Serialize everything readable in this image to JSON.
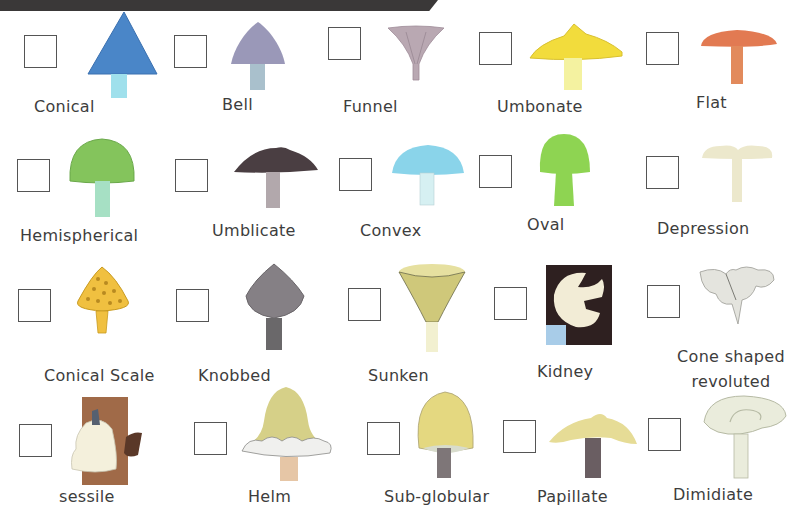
{
  "options": [
    {
      "id": "conical",
      "label": "Conical",
      "checked": false
    },
    {
      "id": "bell",
      "label": "Bell",
      "checked": false
    },
    {
      "id": "funnel",
      "label": "Funnel",
      "checked": false
    },
    {
      "id": "umbonate",
      "label": "Umbonate",
      "checked": false
    },
    {
      "id": "flat",
      "label": "Flat",
      "checked": false
    },
    {
      "id": "hemispherical",
      "label": "Hemispherical",
      "checked": false
    },
    {
      "id": "umblicate",
      "label": "Umblicate",
      "checked": false
    },
    {
      "id": "convex",
      "label": "Convex",
      "checked": false
    },
    {
      "id": "oval",
      "label": "Oval",
      "checked": false
    },
    {
      "id": "depression",
      "label": "Depression",
      "checked": false
    },
    {
      "id": "conical-scale",
      "label": "Conical Scale",
      "checked": false
    },
    {
      "id": "knobbed",
      "label": "Knobbed",
      "checked": false
    },
    {
      "id": "sunken",
      "label": "Sunken",
      "checked": false
    },
    {
      "id": "kidney",
      "label": "Kidney",
      "checked": false
    },
    {
      "id": "cone-shaped-revoluted",
      "label": "Cone shaped\nrevoluted",
      "label_line1": "Cone shaped",
      "label_line2": "revoluted",
      "checked": false
    },
    {
      "id": "sessile",
      "label": "sessile",
      "checked": false
    },
    {
      "id": "helm",
      "label": "Helm",
      "checked": false
    },
    {
      "id": "sub-globular",
      "label": "Sub-globular",
      "checked": false
    },
    {
      "id": "papillate",
      "label": "Papillate",
      "checked": false
    },
    {
      "id": "dimidiate",
      "label": "Dimidiate",
      "checked": false
    }
  ],
  "colors": {
    "topbar": "#3a3838",
    "conical_cap": "#4a86c8",
    "conical_stem": "#9fe0ec",
    "bell_cap": "#9a98b8",
    "bell_stem": "#a9c0cc",
    "funnel": "#b9a8b2",
    "umbonate_cap": "#f2dc3c",
    "umbonate_stem": "#f4f2a0",
    "flat_cap": "#e27a52",
    "flat_stem": "#e28a5c",
    "hemispherical_cap": "#84c45c",
    "hemispherical_stem": "#a6e0c4",
    "umblicate_cap": "#4a3e42",
    "umblicate_stem": "#b2a8ac",
    "convex_cap": "#8ad4ea",
    "convex_stem": "#d6f0f2",
    "oval": "#8ed452",
    "depression": "#ece8cc",
    "conical_scale": "#f0c040",
    "knobbed_cap": "#858085",
    "knobbed_stem": "#6a686a",
    "sunken": "#e6e0a0",
    "kidney_dark": "#2e2020",
    "kidney_cream": "#f2ecd6",
    "kidney_bg": "#a8cce8",
    "revoluted": "#e4e4de",
    "sessile_wood": "#a06a48",
    "sessile_cream": "#f4f0dc",
    "helm_cap": "#d6d088",
    "helm_gills": "#f0f0ee",
    "helm_stem": "#e0b890",
    "subglobular_cap": "#e4d880",
    "subglobular_stem": "#7e7678",
    "papillate_cap": "#e6dc96",
    "papillate_stem": "#6a5e62",
    "dimidiate": "#eaecdc"
  }
}
